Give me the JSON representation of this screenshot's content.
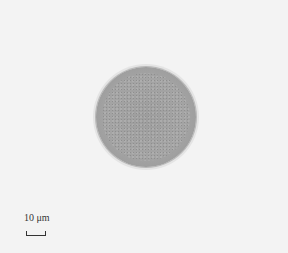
{
  "image": {
    "subject": "single round cell under light microscopy",
    "background_color": "#f3f3f3",
    "cell_color": "#a0a0a0"
  },
  "scale_bar": {
    "label": "10 μm"
  }
}
